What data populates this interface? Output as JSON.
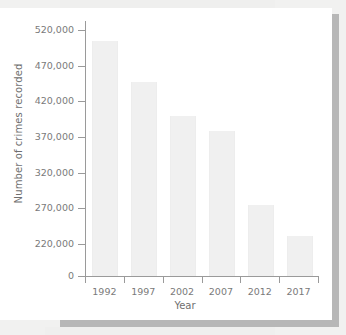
{
  "chart_data": {
    "type": "bar",
    "title": "",
    "xlabel": "Year",
    "ylabel": "Number of crimes recorded",
    "categories": [
      "1992",
      "1997",
      "2002",
      "2007",
      "2012",
      "2017"
    ],
    "values": [
      505000,
      447000,
      400000,
      378000,
      274000,
      231000
    ],
    "ytick_labels": [
      "520,000",
      "470,000",
      "420,000",
      "370,000",
      "320,000",
      "270,000",
      "220,000",
      "0"
    ],
    "ytick_values": [
      520000,
      470000,
      420000,
      370000,
      320000,
      270000,
      220000,
      0
    ],
    "ylim": [
      0,
      520000
    ],
    "axis_note": "value axis is broken between 220,000 and 0",
    "grid": false,
    "legend": "none",
    "bar_color": "#f0f0f0",
    "axis_color": "#9a9a9a",
    "text_color": "#7a7a7a"
  },
  "colors": {
    "page_background": "#f1f1f0",
    "card_background": "#ffffff",
    "shadow": "#b7b7b7"
  }
}
